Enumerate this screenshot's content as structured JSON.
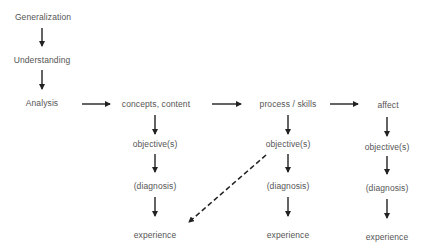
{
  "diagram": {
    "hierarchy": [
      {
        "id": "generalization",
        "label": "Generalization"
      },
      {
        "id": "understanding",
        "label": "Understanding"
      },
      {
        "id": "analysis",
        "label": "Analysis"
      }
    ],
    "columns": [
      {
        "id": "concepts",
        "header": "concepts, content",
        "items": [
          "objective(s)",
          "(diagnosis)",
          "experience"
        ]
      },
      {
        "id": "process",
        "header": "process / skills",
        "items": [
          "objective(s)",
          "(diagnosis)",
          "experience"
        ]
      },
      {
        "id": "affect",
        "header": "affect",
        "items": [
          "objective(s)",
          "(diagnosis)",
          "experience"
        ]
      }
    ],
    "edges": [
      {
        "from": "generalization",
        "to": "understanding",
        "style": "solid"
      },
      {
        "from": "understanding",
        "to": "analysis",
        "style": "solid"
      },
      {
        "from": "analysis",
        "to": "concepts",
        "style": "solid"
      },
      {
        "from": "concepts",
        "to": "process",
        "style": "solid"
      },
      {
        "from": "process",
        "to": "affect",
        "style": "solid"
      },
      {
        "from": "process.objective(s)",
        "to": "concepts.experience",
        "style": "dashed"
      }
    ],
    "colors": {
      "text": "#555555",
      "arrow": "#222222",
      "background": "#ffffff"
    }
  }
}
